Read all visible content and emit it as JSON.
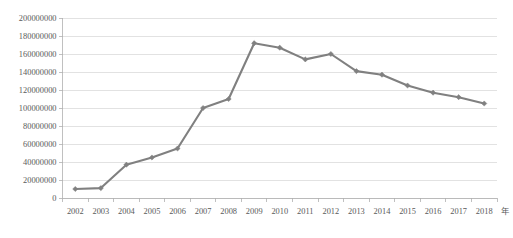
{
  "chart_data": {
    "type": "line",
    "title": "",
    "subtitle": "",
    "xlabel": "年",
    "ylabel": "",
    "x": [
      2002,
      2003,
      2004,
      2005,
      2006,
      2007,
      2008,
      2009,
      2010,
      2011,
      2012,
      2013,
      2014,
      2015,
      2016,
      2017,
      2018
    ],
    "categories": [
      "2002",
      "2003",
      "2004",
      "2005",
      "2006",
      "2007",
      "2008",
      "2009",
      "2010",
      "2011",
      "2012",
      "2013",
      "2014",
      "2015",
      "2016",
      "2017",
      "2018"
    ],
    "values": [
      10000000,
      11000000,
      37000000,
      45000000,
      55000000,
      100000000,
      110000000,
      172000000,
      167000000,
      154000000,
      160000000,
      141000000,
      137000000,
      125000000,
      117000000,
      112000000,
      105000000
    ],
    "series": [
      {
        "name": "",
        "values": [
          10000000,
          11000000,
          37000000,
          45000000,
          55000000,
          100000000,
          110000000,
          172000000,
          167000000,
          154000000,
          160000000,
          141000000,
          137000000,
          125000000,
          117000000,
          112000000,
          105000000
        ],
        "color": "#808080",
        "marker": "diamond"
      }
    ],
    "ylim": [
      0,
      200000000
    ],
    "ytick_values": [
      0,
      20000000,
      40000000,
      60000000,
      80000000,
      100000000,
      120000000,
      140000000,
      160000000,
      180000000,
      200000000
    ],
    "ytick_labels": [
      "0",
      "20000000",
      "40000000",
      "60000000",
      "80000000",
      "100000000",
      "120000000",
      "140000000",
      "160000000",
      "180000000",
      "200000000"
    ],
    "grid": true,
    "grid_axis": "y",
    "legend": false,
    "legend_position": "none"
  },
  "axis": {
    "x_unit_label": "年"
  },
  "colors": {
    "series": "#808080",
    "grid": "#d6d6d6",
    "axis": "#b0b0b0",
    "text": "#5a5a5a",
    "background": "#ffffff"
  }
}
